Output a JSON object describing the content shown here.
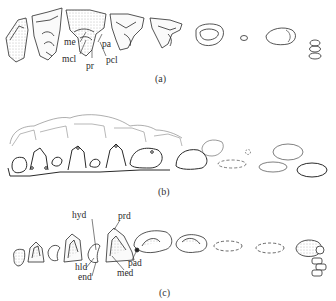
{
  "panels": [
    {
      "caption": "(a)",
      "labels": {
        "me": "me",
        "mcl": "mcl",
        "pr": "pr",
        "pa": "pa",
        "pcl": "pcl"
      }
    },
    {
      "caption": "(b)",
      "labels": {}
    },
    {
      "caption": "(c)",
      "labels": {
        "hyd": "hyd",
        "prd": "prd",
        "hld": "hld",
        "end": "end",
        "pad": "pad",
        "med": "med"
      }
    }
  ],
  "colors": {
    "ink": "#2a2a2a",
    "paper": "#ffffff",
    "shade": "#8a8a8a"
  }
}
